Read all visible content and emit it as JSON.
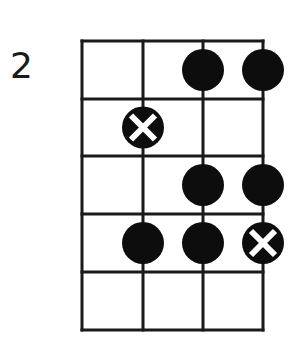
{
  "diagram": {
    "type": "fretboard",
    "starting_fret_label": "2",
    "strings": 4,
    "frets": 5,
    "grid": {
      "string_x": [
        82,
        143,
        203,
        263
      ],
      "fret_y": [
        41,
        99,
        156,
        214,
        272,
        330
      ],
      "line_color": "#1a1a1a"
    },
    "markers": [
      {
        "fret_row": 1,
        "string": 3,
        "kind": "dot"
      },
      {
        "fret_row": 1,
        "string": 4,
        "kind": "dot"
      },
      {
        "fret_row": 2,
        "string": 2,
        "kind": "root-x"
      },
      {
        "fret_row": 3,
        "string": 3,
        "kind": "dot"
      },
      {
        "fret_row": 3,
        "string": 4,
        "kind": "dot"
      },
      {
        "fret_row": 4,
        "string": 2,
        "kind": "dot"
      },
      {
        "fret_row": 4,
        "string": 3,
        "kind": "dot"
      },
      {
        "fret_row": 4,
        "string": 4,
        "kind": "root-x"
      }
    ],
    "colors": {
      "dot": "#0d0d0d",
      "x_mark": "#ffffff"
    }
  }
}
